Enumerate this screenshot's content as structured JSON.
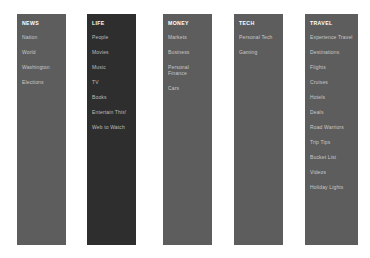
{
  "page": {
    "background_color": "#ffffff",
    "panel_color": "#5d5d5d",
    "panel_color_dark": "#2e2e2e",
    "header_text_color": "#ffffff",
    "item_text_color": "#c9c9c9"
  },
  "nav": {
    "columns": [
      {
        "id": "news",
        "heading": "NEWS",
        "items": [
          {
            "label": "Nation"
          },
          {
            "label": "World"
          },
          {
            "label": "Washington"
          },
          {
            "label": "Elections"
          }
        ]
      },
      {
        "id": "life",
        "heading": "LIFE",
        "items": [
          {
            "label": "People"
          },
          {
            "label": "Movies"
          },
          {
            "label": "Music"
          },
          {
            "label": "TV"
          },
          {
            "label": "Books"
          },
          {
            "label": "Entertain This!"
          },
          {
            "label": "Web to Watch"
          }
        ]
      },
      {
        "id": "money",
        "heading": "MONEY",
        "items": [
          {
            "label": "Markets"
          },
          {
            "label": "Business"
          },
          {
            "label": "Personal Finance"
          },
          {
            "label": "Cars"
          }
        ]
      },
      {
        "id": "tech",
        "heading": "TECH",
        "items": [
          {
            "label": "Personal Tech"
          },
          {
            "label": "Gaming"
          }
        ]
      },
      {
        "id": "travel",
        "heading": "TRAVEL",
        "items": [
          {
            "label": "Experience Travel"
          },
          {
            "label": "Destinations"
          },
          {
            "label": "Flights"
          },
          {
            "label": "Cruises"
          },
          {
            "label": "Hotels"
          },
          {
            "label": "Deals"
          },
          {
            "label": "Road Warriors"
          },
          {
            "label": "Trip Tips"
          },
          {
            "label": "Bucket List"
          },
          {
            "label": "Videos"
          },
          {
            "label": "Holiday Lights"
          }
        ]
      }
    ]
  }
}
